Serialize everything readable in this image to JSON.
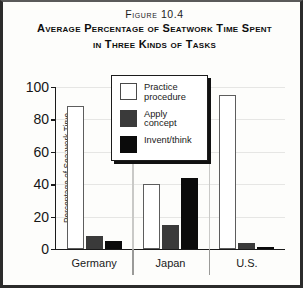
{
  "figure": {
    "number": "Figure 10.4",
    "title_line1": "Average Percentage of Seatwork Time Spent",
    "title_line2": "in Three Kinds of Tasks"
  },
  "legend": {
    "items": [
      {
        "label_line1": "Practice",
        "label_line2": "procedure",
        "color": "#ffffff",
        "key": "practice"
      },
      {
        "label_line1": "Apply",
        "label_line2": "concept",
        "color": "#3a3a3a",
        "key": "apply"
      },
      {
        "label_line1": "Invent/think",
        "label_line2": "",
        "color": "#0b0b0b",
        "key": "invent"
      }
    ]
  },
  "chart_data": {
    "type": "bar",
    "title": "Average Percentage of Seatwork Time Spent in Three Kinds of Tasks",
    "xlabel": "",
    "ylabel": "Percentage of Seatwork Time",
    "categories": [
      "Germany",
      "Japan",
      "U.S."
    ],
    "series": [
      {
        "name": "Practice procedure",
        "color": "#ffffff",
        "values": [
          88,
          40,
          95
        ]
      },
      {
        "name": "Apply concept",
        "color": "#3a3a3a",
        "values": [
          8,
          15,
          4
        ]
      },
      {
        "name": "Invent/think",
        "color": "#0b0b0b",
        "values": [
          5,
          44,
          1
        ]
      }
    ],
    "ylim": [
      0,
      100
    ],
    "yticks": [
      0,
      20,
      40,
      60,
      80,
      100
    ],
    "ytick_labels": [
      "0",
      "20",
      "40",
      "60",
      "80",
      "100"
    ],
    "grid": true,
    "legend_position": "top-center"
  }
}
